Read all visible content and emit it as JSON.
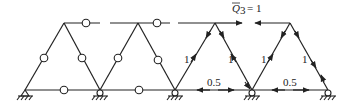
{
  "figure": {
    "type": "truss-diagram",
    "left_part": {
      "description": "mechanism truss with hinges on members",
      "hinge_count": 8
    },
    "right_part": {
      "load_label": "Q̄₃ = 1",
      "load_symbol": "Q",
      "load_subscript": "3",
      "load_value": "= 1",
      "member_labels": [
        "1",
        "1",
        "1",
        "1",
        "0.5",
        "0.5"
      ]
    },
    "supports": {
      "pinned_count": 2,
      "roller_count": 3
    }
  }
}
